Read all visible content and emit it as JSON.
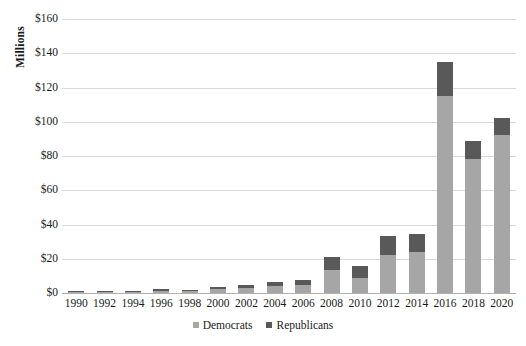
{
  "chart_data": {
    "type": "bar",
    "subtype": "stacked-bar",
    "title": "",
    "xlabel": "",
    "ylabel": "Millions",
    "ylim": [
      0,
      160
    ],
    "ytick_labels": [
      "$160",
      "$140",
      "$120",
      "$100",
      "$80",
      "$60",
      "$40",
      "$20",
      "$0"
    ],
    "ytick_values": [
      160,
      140,
      120,
      100,
      80,
      60,
      40,
      20,
      0
    ],
    "grid": true,
    "legend_position": "bottom",
    "categories": [
      "1990",
      "1992",
      "1994",
      "1996",
      "1998",
      "2000",
      "2002",
      "2004",
      "2006",
      "2008",
      "2010",
      "2012",
      "2014",
      "2016",
      "2018",
      "2020"
    ],
    "series": [
      {
        "name": "Democrats",
        "color": "#a6a6a6",
        "values": [
          0.2,
          0.6,
          0.7,
          1.3,
          1.1,
          2.2,
          2.8,
          4.0,
          4.8,
          13.5,
          9.0,
          22.0,
          24.0,
          115.0,
          78.0,
          92.0
        ]
      },
      {
        "name": "Republicans",
        "color": "#595959",
        "values": [
          0.1,
          0.4,
          0.5,
          0.9,
          0.7,
          1.3,
          1.7,
          2.5,
          2.7,
          7.5,
          7.0,
          11.5,
          10.5,
          20.0,
          11.0,
          10.0
        ]
      }
    ],
    "totals": [
      0.3,
      1.0,
      1.2,
      2.2,
      1.8,
      3.5,
      4.5,
      6.5,
      7.5,
      21.0,
      16.0,
      33.5,
      34.5,
      135.0,
      89.0,
      102.0
    ]
  },
  "legend": {
    "items": [
      {
        "label": "Democrats",
        "color": "#a6a6a6"
      },
      {
        "label": "Republicans",
        "color": "#595959"
      }
    ]
  },
  "axis": {
    "y_title": "Millions"
  }
}
